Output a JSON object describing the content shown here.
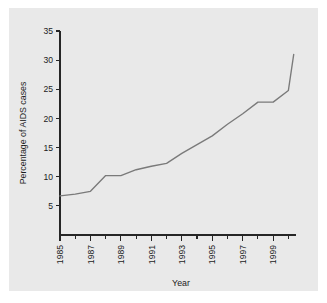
{
  "figure": {
    "background_color": "#e9e9e9",
    "page_background_color": "#ffffff",
    "line_color": "#7a7a7a",
    "axis_color": "#262626"
  },
  "chart_data": {
    "type": "line",
    "title": "",
    "subtitle": "",
    "xlabel": "Year",
    "ylabel": "Percentage of AIDS cases",
    "xlim": [
      1985,
      2000
    ],
    "ylim": [
      5,
      35
    ],
    "grid": false,
    "legend": null,
    "x_major_ticks": [
      1985,
      1987,
      1989,
      1991,
      1993,
      1995,
      1997,
      1999
    ],
    "x_minor_ticks": [
      1986,
      1988,
      1990,
      1992,
      1994,
      1996,
      1998,
      2000
    ],
    "x_tick_labels": [
      "1985",
      "1987",
      "1989",
      "1991",
      "1993",
      "1995",
      "1997",
      "1999"
    ],
    "y_ticks": [
      5,
      10,
      15,
      20,
      25,
      30,
      35
    ],
    "y_tick_labels": [
      "5",
      "10",
      "15",
      "20",
      "25",
      "30",
      "35"
    ],
    "x": [
      1985,
      1986,
      1987,
      1988,
      1989,
      1990,
      1991,
      1992,
      1993,
      1994,
      1995,
      1996,
      1997,
      1998,
      1999,
      2000
    ],
    "values": [
      6.7,
      7.0,
      7.5,
      10.2,
      10.2,
      11.2,
      11.8,
      12.3,
      14.0,
      15.5,
      17.0,
      19.0,
      20.8,
      22.8,
      22.8,
      24.8
    ],
    "series": [
      {
        "name": "Percentage of AIDS cases",
        "values": [
          6.7,
          7.0,
          7.5,
          10.2,
          10.2,
          11.2,
          11.8,
          12.3,
          14.0,
          15.5,
          17.0,
          19.0,
          20.8,
          22.8,
          22.8,
          24.8
        ]
      }
    ],
    "extra_points": [
      {
        "x": 2000.35,
        "y": 31.0
      }
    ]
  }
}
